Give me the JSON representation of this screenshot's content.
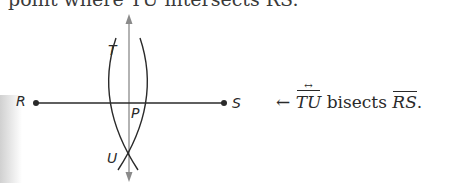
{
  "header": {
    "partial_text": "point where TU intersects RS."
  },
  "diagram": {
    "points": {
      "R": {
        "label": "R"
      },
      "S": {
        "label": "S"
      },
      "T": {
        "label": "T"
      },
      "U": {
        "label": "U"
      },
      "P": {
        "label": "P"
      }
    },
    "segment": "RS",
    "line": "TU",
    "colors": {
      "ink": "#2a2a2a",
      "construction_line": "#8a8a8a"
    }
  },
  "caption": {
    "arrow": "←",
    "subject": "TU",
    "verb": " bisects ",
    "object": "RS",
    "period": "."
  }
}
